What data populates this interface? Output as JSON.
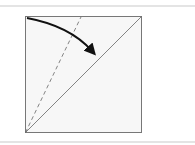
{
  "diagram": {
    "type": "origami-fold-step",
    "colors": {
      "paper": "#f7f7f7",
      "outline": "#777777",
      "arrow": "#111111",
      "rule": "#e4e4e4"
    },
    "square": {
      "x": 25,
      "y": 16,
      "size": 117
    },
    "diagonal": {
      "from": [
        25,
        133
      ],
      "to": [
        142,
        16
      ]
    },
    "dashed_fold": {
      "from": [
        25,
        133
      ],
      "to": [
        81,
        17
      ]
    },
    "arrow": {
      "from": [
        27,
        18
      ],
      "to": [
        97,
        57
      ],
      "direction": "fold-down-right"
    }
  }
}
